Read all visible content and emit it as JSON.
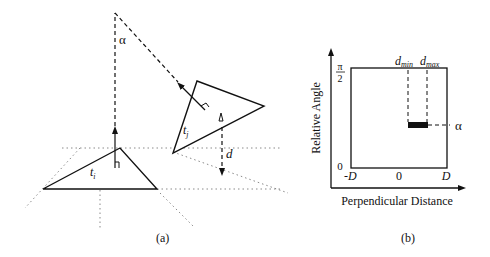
{
  "panel_a": {
    "caption": "(a)",
    "alpha_label": "α",
    "triangle_i_label": "t",
    "triangle_i_sub": "i",
    "triangle_j_label": "t",
    "triangle_j_sub": "j",
    "distance_label": "d"
  },
  "panel_b": {
    "caption": "(b)",
    "y_axis_label": "Relative Angle",
    "x_axis_label": "Perpendicular Distance",
    "y_top_tick_num": "π",
    "y_top_tick_den": "2",
    "y_bottom_tick": "0",
    "x_left_tick": "-D",
    "x_mid_tick": "0",
    "x_right_tick": "D",
    "dmin_label": "d",
    "dmin_sub": "min",
    "dmax_label": "d",
    "dmax_sub": "max",
    "alpha_label": "α"
  },
  "colors": {
    "ink": "#111111",
    "dotted": "#8a8a8a"
  }
}
